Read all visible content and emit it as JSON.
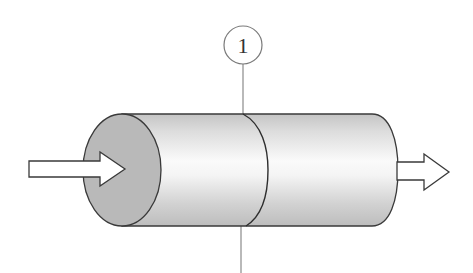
{
  "diagram": {
    "type": "cylindrical reactor / pipe section",
    "section_marker": {
      "label": "1",
      "description": "section line marker at middle of cylinder"
    },
    "inlet_arrow": {
      "direction": "right",
      "description": "flow in"
    },
    "outlet_arrow": {
      "direction": "right",
      "description": "flow out"
    },
    "colors": {
      "stroke": "#3a3a3a",
      "end_face": "#b9b9b9",
      "body_light": "#f6f6f6",
      "body_dark": "#bcbcbc",
      "arrow_fill": "#ffffff",
      "marker_line": "#8a8a8a"
    }
  }
}
